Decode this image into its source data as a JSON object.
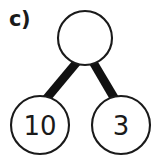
{
  "figure": {
    "label": "c)",
    "type": "number-bond",
    "background_color": "#ffffff",
    "stroke_color": "#1a1a1a",
    "link_color": "#111111"
  },
  "diagram_data": {
    "type": "diagram",
    "kind": "number-bond",
    "title": "c)",
    "nodes": [
      {
        "id": "total",
        "role": "whole",
        "value": "",
        "cx": 85,
        "cy": 38,
        "r": 27,
        "filled": false
      },
      {
        "id": "part-left",
        "role": "part",
        "value": "10",
        "cx": 40,
        "cy": 125,
        "r": 29,
        "filled": false
      },
      {
        "id": "part-right",
        "role": "part",
        "value": "3",
        "cx": 121,
        "cy": 125,
        "r": 29,
        "filled": false
      }
    ],
    "edges": [
      {
        "id": "edge-total-left",
        "from": "total",
        "to": "part-left"
      },
      {
        "id": "edge-total-right",
        "from": "total",
        "to": "part-right"
      }
    ]
  }
}
